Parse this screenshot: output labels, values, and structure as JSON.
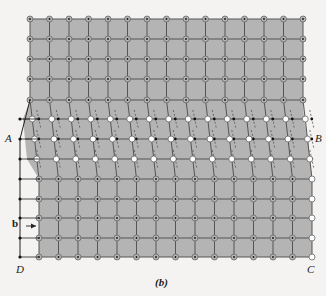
{
  "figure": {
    "caption": "(b)",
    "corner_labels": {
      "A": "A",
      "B": "B",
      "C": "C",
      "D": "D"
    },
    "burgers_label": "b",
    "colors": {
      "fill": "#b4b4b4",
      "line": "#555555",
      "node_ring": "#666666",
      "node_open": "#ffffff",
      "dot": "#111111",
      "circuit": "#222222"
    },
    "upper_lattice": {
      "x_start": 30,
      "dx": 19.5,
      "cols": 15,
      "rows_y": [
        19,
        39,
        59,
        79,
        100
      ]
    },
    "lower_lattice": {
      "x_start": 39,
      "dx": 19.5,
      "cols": 15,
      "rows_y": [
        179,
        199,
        218,
        238,
        257
      ]
    },
    "transition_rows": [
      {
        "y": 119,
        "x_start": 33,
        "x_end": 304
      },
      {
        "y": 139,
        "x_start": 35,
        "x_end": 308
      },
      {
        "y": 159,
        "x_start": 37,
        "x_end": 310
      }
    ],
    "circuit_x": 20
  }
}
